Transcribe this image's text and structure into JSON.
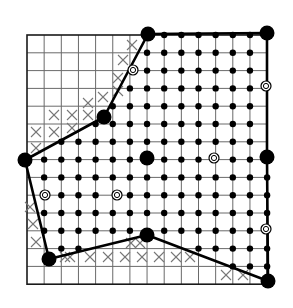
{
  "figure": {
    "kind": "lattice-polygon-diagram",
    "colors": {
      "ink": "#000000",
      "grid": "#6a6a6a",
      "x_mark": "#777777",
      "background": "#ffffff"
    }
  },
  "grid": {
    "cols": 14,
    "rows": 14,
    "x0": 27,
    "y0": 35,
    "dx": 17.15,
    "dy": 17.8
  },
  "polygon": {
    "vertices": [
      [
        148,
        34
      ],
      [
        267,
        33
      ],
      [
        267,
        157
      ],
      [
        268,
        281
      ],
      [
        147,
        235
      ],
      [
        49,
        259
      ],
      [
        25,
        160
      ],
      [
        104,
        117
      ]
    ]
  },
  "special_points": {
    "large_dots": [
      [
        147,
        158
      ]
    ],
    "ringed_points": [
      [
        133,
        70
      ],
      [
        266,
        86
      ],
      [
        45,
        195
      ],
      [
        117,
        195
      ],
      [
        214,
        158
      ],
      [
        266,
        229
      ]
    ]
  },
  "x_marks": [
    [
      123,
      60
    ],
    [
      132,
      45
    ],
    [
      118,
      78
    ],
    [
      103,
      97
    ],
    [
      118,
      91
    ],
    [
      88,
      103
    ],
    [
      54,
      115
    ],
    [
      72,
      115
    ],
    [
      88,
      115
    ],
    [
      36,
      132
    ],
    [
      54,
      132
    ],
    [
      72,
      128
    ],
    [
      36,
      148
    ],
    [
      30,
      207
    ],
    [
      33,
      224
    ],
    [
      36,
      242
    ],
    [
      65,
      257
    ],
    [
      70,
      257
    ],
    [
      90,
      257
    ],
    [
      108,
      257
    ],
    [
      125,
      257
    ],
    [
      142,
      257
    ],
    [
      159,
      257
    ],
    [
      176,
      257
    ],
    [
      190,
      257
    ],
    [
      131,
      243
    ],
    [
      140,
      243
    ],
    [
      226,
      275
    ],
    [
      243,
      275
    ]
  ]
}
